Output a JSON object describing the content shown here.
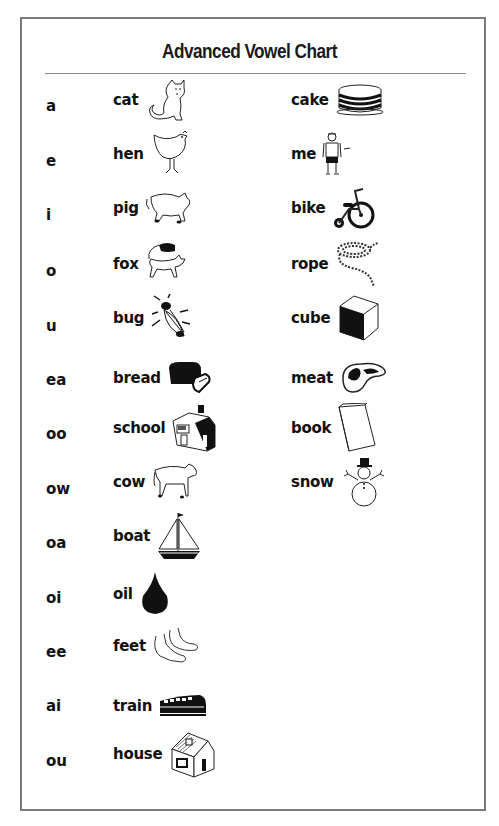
{
  "title": "Advanced Vowel Chart",
  "colors": {
    "frame": "#7a7a7a",
    "rule": "#888888",
    "text": "#111111"
  },
  "rows": [
    {
      "sound": "a",
      "left": {
        "word": "cat",
        "icon": "cat-icon"
      },
      "right": {
        "word": "cake",
        "icon": "cake-icon"
      }
    },
    {
      "sound": "e",
      "left": {
        "word": "hen",
        "icon": "hen-icon"
      },
      "right": {
        "word": "me",
        "icon": "boy-icon"
      }
    },
    {
      "sound": "i",
      "left": {
        "word": "pig",
        "icon": "pig-icon"
      },
      "right": {
        "word": "bike",
        "icon": "tricycle-icon"
      }
    },
    {
      "sound": "o",
      "left": {
        "word": "fox",
        "icon": "fox-icon"
      },
      "right": {
        "word": "rope",
        "icon": "rope-icon"
      }
    },
    {
      "sound": "u",
      "left": {
        "word": "bug",
        "icon": "bug-icon"
      },
      "right": {
        "word": "cube",
        "icon": "cube-icon"
      }
    },
    {
      "sound": "ea",
      "left": {
        "word": "bread",
        "icon": "bread-icon"
      },
      "right": {
        "word": "meat",
        "icon": "steak-icon"
      }
    },
    {
      "sound": "oo",
      "left": {
        "word": "school",
        "icon": "school-icon"
      },
      "right": {
        "word": "book",
        "icon": "book-icon"
      }
    },
    {
      "sound": "ow",
      "left": {
        "word": "cow",
        "icon": "cow-icon"
      },
      "right": {
        "word": "snow",
        "icon": "snowman-icon"
      }
    },
    {
      "sound": "oa",
      "left": {
        "word": "boat",
        "icon": "sailboat-icon"
      }
    },
    {
      "sound": "oi",
      "left": {
        "word": "oil",
        "icon": "oil-drop-icon"
      }
    },
    {
      "sound": "ee",
      "left": {
        "word": "feet",
        "icon": "feet-icon"
      }
    },
    {
      "sound": "ai",
      "left": {
        "word": "train",
        "icon": "train-icon"
      }
    },
    {
      "sound": "ou",
      "left": {
        "word": "house",
        "icon": "house-icon"
      }
    }
  ]
}
